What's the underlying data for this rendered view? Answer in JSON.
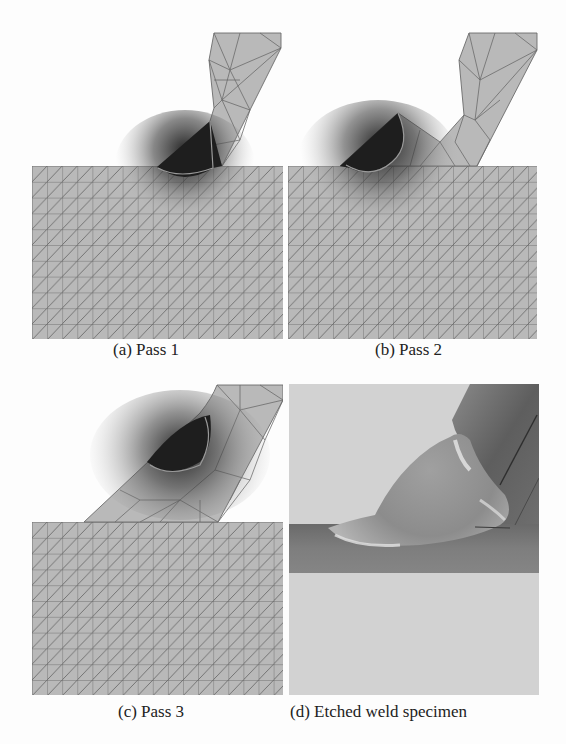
{
  "figure": {
    "panels": [
      {
        "id": "a",
        "caption": "(a) Pass 1"
      },
      {
        "id": "b",
        "caption": "(b) Pass 2"
      },
      {
        "id": "c",
        "caption": "(c) Pass 3"
      },
      {
        "id": "d",
        "caption": "(d) Etched weld specimen"
      }
    ]
  },
  "colors": {
    "background": "#fdfdfd",
    "mesh_fill": "#b8b8b8",
    "mesh_line": "#6e6e6e",
    "weld_pool": "#1e1e1e",
    "fusion_boundary": "#9a9a9a",
    "photo_light": "#d2d2d2",
    "photo_dark_plate": "#7c7c7c",
    "caption_text": "#222222"
  }
}
